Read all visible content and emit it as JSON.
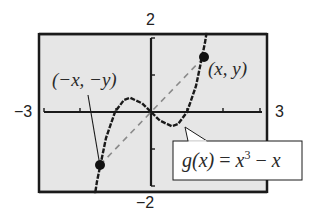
{
  "figure": {
    "window": {
      "xmin": -3,
      "xmax": 3,
      "ymin": -2,
      "ymax": 2
    },
    "labels": {
      "ymax": "2",
      "ymin": "−2",
      "xmin": "−3",
      "xmax": "3",
      "point_pos": "(x, y)",
      "point_neg": "(−x, −y)",
      "function_name": "g(x)",
      "function_eq": "=",
      "function_rhs_base": "x",
      "function_rhs_exp": "3",
      "function_rhs_tail": "− x"
    },
    "colors": {
      "screen_bg": "#e6e6e6",
      "frame": "#1a1a1a",
      "curve": "#1a1a1a",
      "dashed": "#8a8a8a",
      "callout_bg": "#ffffff"
    }
  },
  "chart_data": {
    "type": "line",
    "title": "",
    "function": "g(x) = x^3 - x",
    "xlabel": "",
    "ylabel": "",
    "xlim": [
      -3,
      3
    ],
    "ylim": [
      -2,
      2
    ],
    "grid": false,
    "x_ticks": [
      -2,
      -1,
      1,
      2
    ],
    "y_ticks": [
      -1,
      1
    ],
    "window_labels": {
      "xmin": "-3",
      "xmax": "3",
      "ymin": "-2",
      "ymax": "2"
    },
    "series": [
      {
        "name": "g(x) = x^3 - x",
        "x": [
          -1.6,
          -1.5,
          -1.25,
          -1.0,
          -0.75,
          -0.577,
          -0.25,
          0,
          0.25,
          0.577,
          0.75,
          1.0,
          1.25,
          1.5,
          1.6
        ],
        "y": [
          -2.496,
          -1.875,
          -0.703,
          0,
          0.328,
          0.385,
          0.234,
          0,
          -0.234,
          -0.385,
          -0.328,
          0,
          0.703,
          1.875,
          2.496
        ]
      },
      {
        "name": "symmetry line (dashed)",
        "x": [
          -1.45,
          1.45
        ],
        "y": [
          -1.6,
          1.6
        ]
      }
    ],
    "points": [
      {
        "label": "(x, y)",
        "x": 1.45,
        "y": 1.6
      },
      {
        "label": "(-x, -y)",
        "x": -1.45,
        "y": -1.6
      }
    ],
    "annotations": [
      "(x, y)",
      "(-x, -y)",
      "g(x) = x^3 - x"
    ]
  }
}
